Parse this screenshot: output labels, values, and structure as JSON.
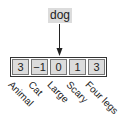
{
  "word": "dog",
  "vector": {
    "values": [
      "3",
      "−1",
      "0",
      "1",
      "3"
    ],
    "features": [
      "Animal",
      "Cat",
      "Large",
      "Scary",
      "Four legs"
    ]
  },
  "colors": {
    "cell_fill": "#dcdcdc",
    "border": "#333333"
  }
}
